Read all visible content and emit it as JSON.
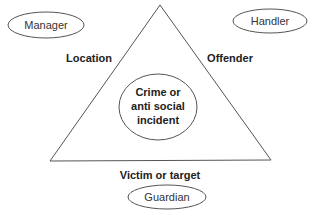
{
  "diagram": {
    "center": {
      "lines": [
        "Crime or",
        "anti social",
        "incident"
      ]
    },
    "sides": {
      "left": "Location",
      "right": "Offender",
      "bottom": "Victim or target"
    },
    "controllers": {
      "manager": "Manager",
      "handler": "Handler",
      "guardian": "Guardian"
    },
    "colors": {
      "stroke": "#555555",
      "text": "#222222",
      "background": "#ffffff"
    }
  }
}
